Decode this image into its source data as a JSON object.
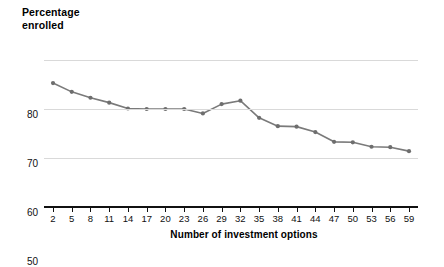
{
  "chart_data": {
    "type": "line",
    "title": "",
    "ylabel": "Percentage enrolled",
    "ylabel_lines": [
      "Percentage",
      "enrolled"
    ],
    "xlabel": "Number of investment options",
    "ylim": [
      50,
      80
    ],
    "yticks": [
      50,
      60,
      70,
      80
    ],
    "ytick_labels": [
      "50",
      "60",
      "70",
      "80"
    ],
    "xlim": [
      2,
      59
    ],
    "xticks": [
      2,
      5,
      8,
      11,
      14,
      17,
      20,
      23,
      26,
      29,
      32,
      35,
      38,
      41,
      44,
      47,
      50,
      53,
      56,
      59
    ],
    "xtick_labels": [
      "2",
      "5",
      "8",
      "11",
      "14",
      "17",
      "20",
      "23",
      "26",
      "29",
      "32",
      "35",
      "38",
      "41",
      "44",
      "47",
      "50",
      "53",
      "56",
      "59"
    ],
    "grid": true,
    "grid_axis": "y",
    "legend": false,
    "x": [
      2,
      5,
      8,
      11,
      14,
      17,
      20,
      23,
      26,
      29,
      32,
      35,
      38,
      41,
      44,
      47,
      50,
      53,
      56,
      59
    ],
    "values": [
      75.3,
      73.5,
      72.3,
      71.3,
      70.1,
      70.0,
      70.0,
      70.0,
      69.1,
      71.0,
      71.7,
      68.2,
      66.5,
      66.4,
      65.3,
      63.3,
      63.2,
      62.3,
      62.2,
      61.4
    ],
    "series": [
      {
        "name": "Percentage enrolled",
        "color": "#7a7a7a",
        "marker": "circle",
        "values": [
          75.3,
          73.5,
          72.3,
          71.3,
          70.1,
          70.0,
          70.0,
          70.0,
          69.1,
          71.0,
          71.7,
          68.2,
          66.5,
          66.4,
          65.3,
          63.3,
          63.2,
          62.3,
          62.2,
          61.4
        ]
      }
    ]
  },
  "colors": {
    "line": "#7a7a7a",
    "marker": "#6e6e6e",
    "grid": "#d9d9d9",
    "axis": "#111111",
    "text": "#000000",
    "background": "#ffffff"
  }
}
